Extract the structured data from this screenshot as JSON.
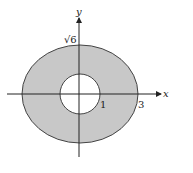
{
  "diagram": {
    "type": "annular region between circle and ellipse",
    "axes": {
      "x_label": "x",
      "y_label": "y"
    },
    "outer_ellipse": {
      "equation_hint": "x^2/9 + y^2/6 = 1",
      "semi_axis_x_label": "3",
      "semi_axis_y_label": "√6"
    },
    "inner_circle": {
      "radius_label": "1"
    },
    "colors": {
      "region_fill": "#c8c8c8",
      "hole_fill": "#ffffff",
      "stroke": "#333333"
    }
  }
}
